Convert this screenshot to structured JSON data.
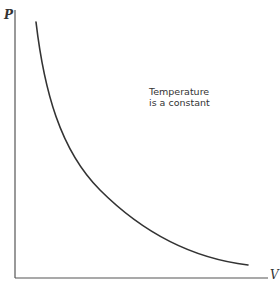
{
  "figure": {
    "y_axis_label": "P",
    "x_axis_label": "V",
    "annotation": {
      "line1": "Temperature",
      "line2": "is a constant"
    },
    "curve_description": "Isotherm: pressure decreases hyperbolically as volume increases (PV = constant)",
    "colors": {
      "line": "#333333",
      "axis": "#555555",
      "background": "#ffffff"
    }
  }
}
